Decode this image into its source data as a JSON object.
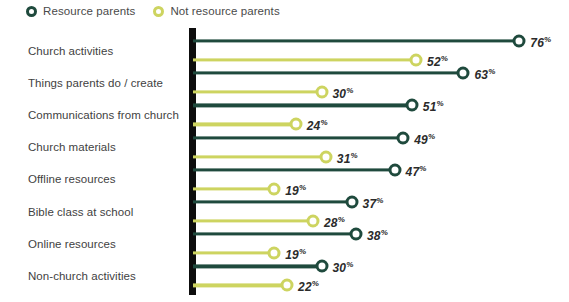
{
  "legend": {
    "items": [
      {
        "label": "Resource parents",
        "color": "#1f4a3d",
        "marker": "ring-icon"
      },
      {
        "label": "Not resource parents",
        "color": "#cdd460",
        "marker": "ring-icon"
      }
    ]
  },
  "chart_data": {
    "type": "bar",
    "subtype": "paired-lollipop",
    "title": "",
    "subtitle": "",
    "xlabel": "",
    "ylabel": "",
    "xlim": [
      0,
      80
    ],
    "grid": false,
    "legend_position": "top-left",
    "value_suffix": "%",
    "categories": [
      "Church activities",
      "Things parents do / create",
      "Communications from church",
      "Church materials",
      "Offline resources",
      "Bible class at school",
      "Online resources",
      "Non-church activities"
    ],
    "series": [
      {
        "name": "Resource parents",
        "color": "#1f4a3d",
        "values": [
          76,
          63,
          51,
          49,
          47,
          37,
          38,
          30
        ]
      },
      {
        "name": "Not resource parents",
        "color": "#cdd460",
        "values": [
          52,
          30,
          24,
          31,
          19,
          28,
          19,
          22
        ]
      }
    ],
    "value_labels": {
      "Resource parents": [
        "76",
        "63",
        "51",
        "49",
        "47",
        "37",
        "38",
        "30"
      ],
      "Not resource parents": [
        "52",
        "30",
        "24",
        "31",
        "19",
        "28",
        "19",
        "22"
      ]
    }
  },
  "axis": {
    "baseline_color": "#0d0d0d"
  }
}
